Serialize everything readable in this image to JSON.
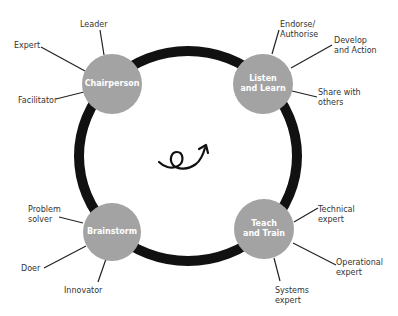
{
  "diagram": {
    "type": "cycle",
    "colors": {
      "ring": "#111111",
      "node_fill": "#a3a3a3",
      "node_text": "#ffffff",
      "label_text": "#333333"
    },
    "center_icon": "curly-arrow-icon",
    "nodes": [
      {
        "id": "chairperson",
        "title": "Chairperson",
        "cx": 112,
        "cy": 84,
        "r": 30,
        "roles": [
          {
            "text": "Leader",
            "x": 80,
            "y": 20,
            "line": [
              100,
              30,
              104,
              55
            ]
          },
          {
            "text": "Expert",
            "x": 14,
            "y": 41,
            "line": [
              41,
              47,
              85,
              71
            ]
          },
          {
            "text": "Facilitator",
            "x": 18,
            "y": 96,
            "line": [
              56,
              99,
              84,
              92
            ]
          }
        ]
      },
      {
        "id": "listen-and-learn",
        "title": "Listen\nand Learn",
        "cx": 263,
        "cy": 84,
        "r": 30,
        "roles": [
          {
            "text": "Endorse/\nAuthorise",
            "x": 280,
            "y": 20,
            "line": [
              279,
              30,
              272,
              54
            ]
          },
          {
            "text": "Develop\nand Action",
            "x": 334,
            "y": 36,
            "line": [
              332,
              45,
              291,
              68
            ]
          },
          {
            "text": "Share with\nothers",
            "x": 318,
            "y": 88,
            "line": [
              317,
              97,
              292,
              91
            ]
          }
        ]
      },
      {
        "id": "brainstorm",
        "title": "Brainstorm",
        "cx": 112,
        "cy": 232,
        "r": 29,
        "roles": [
          {
            "text": "Problem\nsolver",
            "x": 28,
            "y": 205,
            "line": [
              59,
              217,
              83,
              223
            ]
          },
          {
            "text": "Doer",
            "x": 21,
            "y": 264,
            "line": [
              44,
              268,
              86,
              246
            ]
          },
          {
            "text": "Innovator",
            "x": 64,
            "y": 286,
            "line": [
              98,
              282,
              106,
              259
            ]
          }
        ]
      },
      {
        "id": "teach-and-train",
        "title": "Teach\nand Train",
        "cx": 264,
        "cy": 229,
        "r": 30,
        "roles": [
          {
            "text": "Technical\nexpert",
            "x": 318,
            "y": 205,
            "line": [
              318,
              208,
              294,
              222
            ]
          },
          {
            "text": "Operational\nexpert",
            "x": 336,
            "y": 258,
            "line": [
              336,
              265,
              293,
              243
            ]
          },
          {
            "text": "Systems\nexpert",
            "x": 275,
            "y": 286,
            "line": [
              280,
              281,
              274,
              258
            ]
          }
        ]
      }
    ]
  }
}
